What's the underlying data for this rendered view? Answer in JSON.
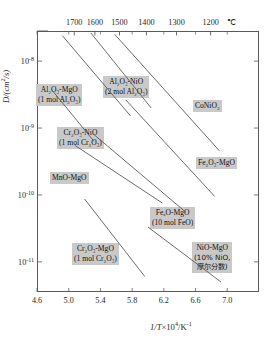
{
  "chart_data": {
    "type": "line",
    "title": "",
    "xlabel": "1/T×10⁴/K⁻¹",
    "ylabel": "D/(cm²/s)",
    "xlim": [
      4.6,
      7.4
    ],
    "ylim": [
      -11.45,
      -7.55
    ],
    "yscale": "log",
    "grid": false,
    "legend_position": "inline-labels",
    "x_ticks": [
      "4.6",
      "5.0",
      "5.4",
      "5.8",
      "6.2",
      "6.6",
      "7.0"
    ],
    "x_tick_values": [
      4.6,
      5.0,
      5.4,
      5.8,
      6.2,
      6.6,
      7.0
    ],
    "y_ticks": [
      "10",
      "10",
      "10",
      "10"
    ],
    "y_tick_exponents": [
      "-8",
      "-9",
      "-10",
      "-11"
    ],
    "y_tick_values": [
      -8,
      -9,
      -10,
      -11
    ],
    "secondary_axis": {
      "position": "top",
      "unit": "℃",
      "label": "Temperature",
      "ticks": [
        "1700",
        "1600",
        "1500",
        "1400",
        "1300",
        "1200"
      ],
      "tick_values_celsius": [
        1700,
        1600,
        1500,
        1400,
        1300,
        1200
      ],
      "tick_positions_invT": [
        5.07,
        5.33,
        5.64,
        5.98,
        6.36,
        6.79
      ]
    },
    "series": [
      {
        "name": "Al2O3-MgO (1 mol Al2O3)",
        "label_line1": "Al₂O₃-MgO",
        "label_line2": "(1 mol Al₂O₃)",
        "x": [
          4.92,
          5.78
        ],
        "y": [
          -7.62,
          -8.82
        ]
      },
      {
        "name": "Al2O3-NiO (2 mol Al2O3)",
        "label_line1": "Al₂O₃-NiO",
        "label_line2": "(2 mol Al₂O₃)",
        "x": [
          5.28,
          6.04
        ],
        "y": [
          -7.58,
          -8.7
        ]
      },
      {
        "name": "CoNiO2",
        "label_line1": "CoNiO₂",
        "label_line2": "",
        "x": [
          5.58,
          6.9
        ],
        "y": [
          -7.6,
          -9.34
        ]
      },
      {
        "name": "Cr2O3-NiO (1 mol Cr2O3)",
        "label_line1": "Cr₂O₃-NiO",
        "label_line2": "(1 mol Cr₂O₃)",
        "x": [
          4.78,
          5.32
        ],
        "y": [
          -8.42,
          -9.2
        ]
      },
      {
        "name": "Fe2O3-MgO",
        "label_line1": "Fe₂O₃-MgO",
        "label_line2": "",
        "x": [
          5.72,
          6.84
        ],
        "y": [
          -8.58,
          -10.02
        ]
      },
      {
        "name": "MnO-MgO",
        "label_line1": "MnO-MgO",
        "label_line2": "",
        "x": [
          5.08,
          6.18
        ],
        "y": [
          -9.26,
          -10.12
        ]
      },
      {
        "name": "FexO-MgO (10 mol FeO)",
        "label_line1": "FeₓO-MgO",
        "label_line2": "(10 mol FeO)",
        "x": [
          5.3,
          6.48
        ],
        "y": [
          -9.08,
          -10.26
        ]
      },
      {
        "name": "Cr2O3-MgO (1 mol Cr2O3)",
        "label_line1": "Cr₂O₃-MgO",
        "label_line2": "(1 mol Cr₂O₃)",
        "x": [
          5.2,
          5.96
        ],
        "y": [
          -10.06,
          -11.22
        ]
      },
      {
        "name": "NiO-MgO (10% NiO, mole fraction)",
        "label_line1": "NiO-MgO",
        "label_line2": "(10% NiO,",
        "label_line3": "摩尔分数)",
        "x": [
          6.0,
          6.92
        ],
        "y": [
          -10.48,
          -11.3
        ]
      }
    ]
  },
  "axes": {
    "y_title_main": "D/(cm",
    "y_title_sup": "2",
    "y_title_tail": "/s)",
    "x_title_pre": "1/T",
    "x_title_mid": "×10",
    "x_title_sup": "4",
    "x_title_tail": "/K",
    "x_title_sup2": "-1",
    "temp_unit": "℃"
  }
}
